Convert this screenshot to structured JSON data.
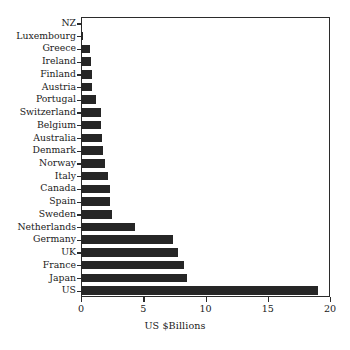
{
  "chart_data": {
    "type": "bar",
    "orientation": "horizontal",
    "title": "",
    "xlabel": "US $Billions",
    "ylabel": "",
    "xlim": [
      0,
      20
    ],
    "ylim": null,
    "grid": true,
    "grid_axis": "x",
    "legend": null,
    "xticks": [
      0,
      5,
      10,
      15,
      20
    ],
    "xticklabels": [
      "0",
      "5",
      "10",
      "15",
      "20"
    ],
    "categories": [
      "NZ",
      "Luxembourg",
      "Greece",
      "Ireland",
      "Finland",
      "Austria",
      "Portugal",
      "Switzerland",
      "Belgium",
      "Australia",
      "Denmark",
      "Norway",
      "Italy",
      "Canada",
      "Spain",
      "Sweden",
      "Netherlands",
      "Germany",
      "UK",
      "France",
      "Japan",
      "US"
    ],
    "values": [
      0.1,
      0.2,
      0.7,
      0.8,
      0.9,
      0.9,
      1.2,
      1.6,
      1.6,
      1.7,
      1.8,
      1.9,
      2.2,
      2.3,
      2.3,
      2.5,
      4.3,
      7.4,
      7.8,
      8.3,
      8.5,
      19.0
    ],
    "bar_color": "#262626",
    "grid_color": "#9a9a9a",
    "axis_color": "#2b2b2b"
  }
}
